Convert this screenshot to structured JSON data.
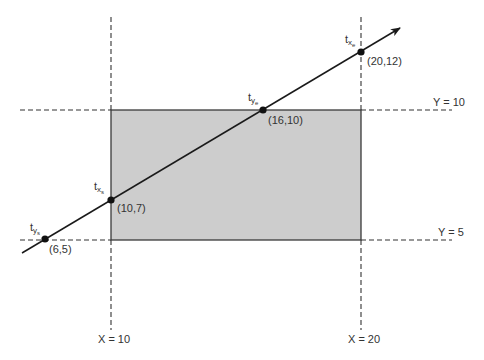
{
  "diagram": {
    "type": "line-clipping (Liang-Barsky parametric intersections)",
    "colors": {
      "clip_rect_fill": "#cdcdcd",
      "clip_rect_stroke": "#3a3a3a",
      "line": "#1a1a1a",
      "dashed": "#333333",
      "text": "#333333",
      "point": "#111111"
    },
    "boundaries": {
      "x_min": {
        "label": "X = 10",
        "value": 10
      },
      "x_max": {
        "label": "X = 20",
        "value": 20
      },
      "y_max": {
        "label": "Y = 10",
        "value": 10
      },
      "y_min": {
        "label": "Y = 5",
        "value": 5
      }
    },
    "points": [
      {
        "id": "t_ys",
        "param": "t",
        "sub": "y",
        "subsub": "s",
        "coord_label": "(6,5)",
        "x": 6,
        "y": 5
      },
      {
        "id": "t_xs",
        "param": "t",
        "sub": "x",
        "subsub": "s",
        "coord_label": "(10,7)",
        "x": 10,
        "y": 7
      },
      {
        "id": "t_ye",
        "param": "t",
        "sub": "y",
        "subsub": "e",
        "coord_label": "(16,10)",
        "x": 16,
        "y": 10
      },
      {
        "id": "t_xe",
        "param": "t",
        "sub": "x",
        "subsub": "e",
        "coord_label": "(20,12)",
        "x": 20,
        "y": 12
      }
    ]
  }
}
